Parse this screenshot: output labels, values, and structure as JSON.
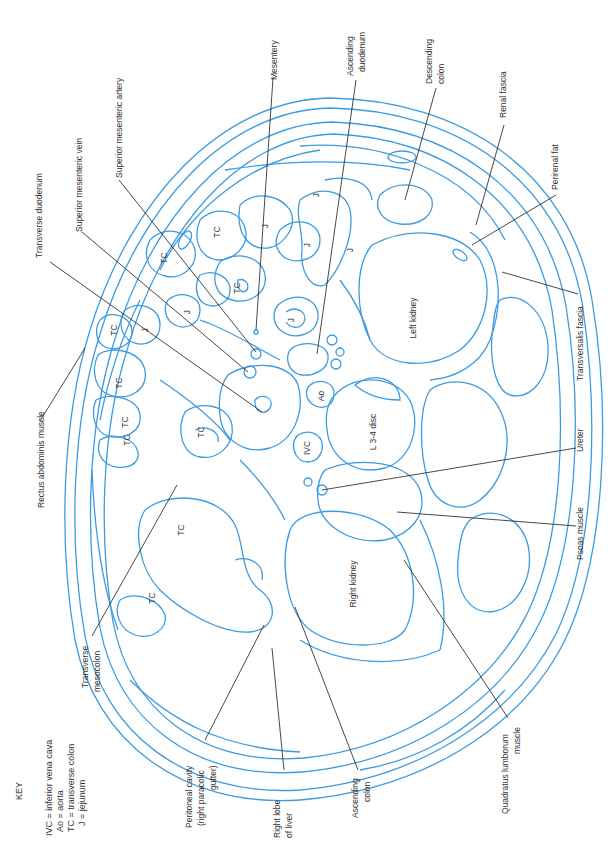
{
  "figure": {
    "line_color": "#3d9be0",
    "leader_color": "#333333"
  },
  "key": {
    "title": "KEY",
    "entries": [
      "IVC = inferior vena cava",
      "Ao = aorta",
      "TC = transverse colon",
      "J = jejunum"
    ]
  },
  "labels": {
    "transverse_duodenum": "Transverse duodenum",
    "superior_mesenteric_vein": "Superior mesenteric vein",
    "superior_mesenteric_artery": "Superior mesenteric artery",
    "mesentery": "Mesentery",
    "ascending_duodenum_1": "Ascending",
    "ascending_duodenum_2": "duodenum",
    "descending_colon_1": "Descending",
    "descending_colon_2": "colon",
    "renal_fascia": "Renal fascia",
    "perirenal_fat": "Perirenal fat",
    "transversalis_fascia": "Transversalis fascia",
    "ureter": "Ureter",
    "psoas_muscle": "Psoas muscle",
    "quadratus_lumborum_1": "Quadratus lumborum",
    "quadratus_lumborum_2": "muscle",
    "ascending_colon_1": "Ascending",
    "ascending_colon_2": "colon",
    "right_lobe_liver_1": "Right lobe",
    "right_lobe_liver_2": "of liver",
    "peritoneal_cavity_1": "Peritoneal cavity",
    "peritoneal_cavity_2": "(right paracolic",
    "peritoneal_cavity_3": "gutter)",
    "transverse_mesocolon_1": "Transverse",
    "transverse_mesocolon_2": "mesocolon",
    "rectus_abdominis": "Rectus abdominis muscle"
  },
  "organs": {
    "left_kidney": "Left kidney",
    "right_kidney": "Right kidney",
    "disc": "L 3-4 disc",
    "aorta": "Ao",
    "ivc": "IVC",
    "tc": "TC",
    "j": "J"
  }
}
